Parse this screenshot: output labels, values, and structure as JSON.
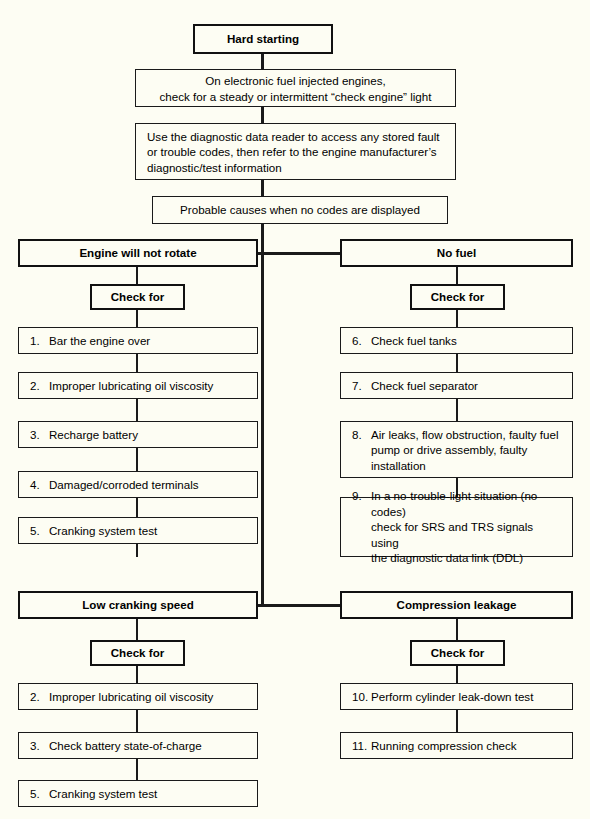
{
  "diagram": {
    "title": "Hard starting",
    "type": "troubleshooting-flowchart",
    "root": {
      "label": "Hard starting"
    },
    "steps": [
      {
        "id": "efi-check",
        "line1": "On electronic fuel injected engines,",
        "line2": "check for a steady or intermittent “check engine” light"
      },
      {
        "id": "data-reader",
        "line1": "Use the diagnostic data reader to access any stored fault",
        "line2": "or trouble codes, then refer to the engine manufacturer’s",
        "line3": "diagnostic/test information"
      },
      {
        "id": "probable-causes",
        "line1": "Probable causes when no codes are displayed"
      }
    ],
    "check_for_label": "Check for",
    "branches": [
      {
        "id": "engine-will-not-rotate",
        "heading": "Engine will not rotate",
        "column": "left",
        "row": 1,
        "items": [
          {
            "num": "1.",
            "text": "Bar the engine over"
          },
          {
            "num": "2.",
            "text": "Improper lubricating oil viscosity"
          },
          {
            "num": "3.",
            "text": "Recharge battery"
          },
          {
            "num": "4.",
            "text": "Damaged/corroded terminals"
          },
          {
            "num": "5.",
            "text": "Cranking system test"
          }
        ]
      },
      {
        "id": "no-fuel",
        "heading": "No fuel",
        "column": "right",
        "row": 1,
        "items": [
          {
            "num": "6.",
            "text": "Check fuel tanks"
          },
          {
            "num": "7.",
            "text": "Check fuel separator"
          },
          {
            "num": "8.",
            "text": "Air leaks, flow obstruction, faulty fuel pump or drive assembly, faulty installation",
            "lines": [
              "Air leaks, flow obstruction, faulty fuel",
              "pump or drive assembly, faulty",
              "installation"
            ]
          },
          {
            "num": "9.",
            "text": "In a no-trouble-light situation (no codes) check for SRS and TRS signals using the diagnostic data link (DDL)",
            "lines": [
              "In a no-trouble-light situation (no codes)",
              "check for SRS and TRS signals using",
              "the diagnostic data link (DDL)"
            ]
          }
        ]
      },
      {
        "id": "low-cranking-speed",
        "heading": "Low cranking speed",
        "column": "left",
        "row": 2,
        "items": [
          {
            "num": "2.",
            "text": "Improper lubricating oil viscosity"
          },
          {
            "num": "3.",
            "text": "Check battery state-of-charge"
          },
          {
            "num": "5.",
            "text": "Cranking system test"
          }
        ]
      },
      {
        "id": "compression-leakage",
        "heading": "Compression leakage",
        "column": "right",
        "row": 2,
        "items": [
          {
            "num": "10.",
            "text": "Perform cylinder leak-down test"
          },
          {
            "num": "11.",
            "text": "Running compression check"
          }
        ]
      }
    ],
    "colors": {
      "paper": "#fdfdf3",
      "ink": "#1a1a1a"
    }
  }
}
